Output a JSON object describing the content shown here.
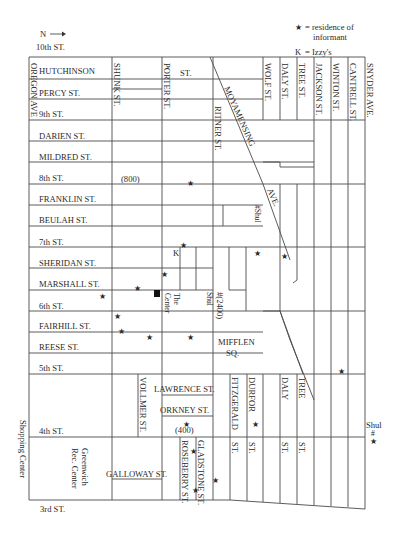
{
  "legend": {
    "north": "N",
    "north_arrow": "⟶",
    "star_symbol": "★",
    "star_meaning": "= residence of informant",
    "star_line1": "= residence of",
    "star_line2": "informant",
    "k_symbol": "K",
    "k_meaning": "= Izzy's"
  },
  "horizontal_streets": [
    {
      "name": "10th ST.",
      "y": 47,
      "x": 36
    },
    {
      "name": "HUTCHINSON",
      "y": 74,
      "x": 39
    },
    {
      "name": "PERCY ST.",
      "y": 97,
      "x": 39
    },
    {
      "name": "9th ST.",
      "y": 118,
      "x": 39
    },
    {
      "name": "DARIEN ST.",
      "y": 140,
      "x": 39
    },
    {
      "name": "MILDRED ST.",
      "y": 161,
      "x": 39
    },
    {
      "name": "8th ST.",
      "y": 182,
      "x": 39
    },
    {
      "name": "FRANKLIN ST.",
      "y": 203,
      "x": 39
    },
    {
      "name": "BEULAH ST.",
      "y": 224,
      "x": 39
    },
    {
      "name": "7th ST.",
      "y": 246,
      "x": 39
    },
    {
      "name": "SHERIDAN ST.",
      "y": 267,
      "x": 39
    },
    {
      "name": "MARSHALL ST.",
      "y": 288,
      "x": 39
    },
    {
      "name": "6th ST.",
      "y": 310,
      "x": 39
    },
    {
      "name": "FAIRHILL ST.",
      "y": 330,
      "x": 39
    },
    {
      "name": "REESE ST.",
      "y": 351,
      "x": 39
    },
    {
      "name": "5th ST.",
      "y": 372,
      "x": 39
    },
    {
      "name": "4th ST.",
      "y": 435,
      "x": 39
    },
    {
      "name": "3rd ST.",
      "y": 510,
      "x": 40
    }
  ],
  "vertical_streets": [
    {
      "name": "OREGON AVE",
      "x": 30,
      "y": 62
    },
    {
      "name": "SHUNK ST.",
      "x": 113,
      "y": 62
    },
    {
      "name": "PORTER ST.",
      "x": 163,
      "y": 62
    },
    {
      "name": "RITNER ST.",
      "x": 214,
      "y": 104
    },
    {
      "name": "WOLF ST.",
      "x": 264,
      "y": 62
    },
    {
      "name": "DALY ST.",
      "x": 281,
      "y": 62
    },
    {
      "name": "TREE ST.",
      "x": 298,
      "y": 62
    },
    {
      "name": "JACKSON ST.",
      "x": 315,
      "y": 62
    },
    {
      "name": "WINTON ST.",
      "x": 332,
      "y": 62
    },
    {
      "name": "CANTRELL ST.",
      "x": 349,
      "y": 62
    },
    {
      "name": "SNYDER AVE.",
      "x": 366,
      "y": 62
    }
  ],
  "other_labels": {
    "porter_st_suffix": "ST.",
    "moyamensing": "MOYAMENSING",
    "ave": "AVE.",
    "block_800": "(800)",
    "block_400": "(400)",
    "block_2400": "#(2400)",
    "shul_2400": "Shul",
    "shul_moyamensing": "#Shul",
    "the_center_1": "The",
    "the_center_2": "Center",
    "mifflen_1": "MIFFLEN",
    "mifflen_2": "SQ.",
    "lawrence": "LAWRENCE ST.",
    "orkney": "ORKNEY ST.",
    "vollmer": "VOLLMER ST.",
    "galloway": "GALLOWAY ST.",
    "roseberry": "ROSEBERRY ST.",
    "gladstone": "GLADSTONE ST.",
    "fitzgerald": "FITZGERALD",
    "fitzgerald_st": "ST.",
    "durfor": "DURFOR",
    "durfor_st": "ST.",
    "daly_lower": "DALY",
    "daly_lower_st": "ST.",
    "tree_lower": "TREE",
    "tree_lower_st": "ST.",
    "greenwich_1": "Greenwich",
    "greenwich_2": "Rec. Center",
    "shopping_center": "Shopping Center",
    "shul_right": "Shul",
    "shul_right_hash": "#",
    "izzys_marker": "K"
  },
  "markers": {
    "informant_residences": [
      {
        "x": 190,
        "y": 183
      },
      {
        "x": 183,
        "y": 245
      },
      {
        "x": 257,
        "y": 253
      },
      {
        "x": 284,
        "y": 256
      },
      {
        "x": 164,
        "y": 274
      },
      {
        "x": 137,
        "y": 288
      },
      {
        "x": 102,
        "y": 296
      },
      {
        "x": 117,
        "y": 316
      },
      {
        "x": 121,
        "y": 331
      },
      {
        "x": 149,
        "y": 337
      },
      {
        "x": 190,
        "y": 337
      },
      {
        "x": 341,
        "y": 371
      },
      {
        "x": 186,
        "y": 424
      },
      {
        "x": 255,
        "y": 424
      },
      {
        "x": 193,
        "y": 451
      },
      {
        "x": 215,
        "y": 480
      },
      {
        "x": 195,
        "y": 490
      },
      {
        "x": 373,
        "y": 441
      }
    ],
    "the_center_square": {
      "x": 154,
      "y": 293,
      "size": 6
    }
  }
}
